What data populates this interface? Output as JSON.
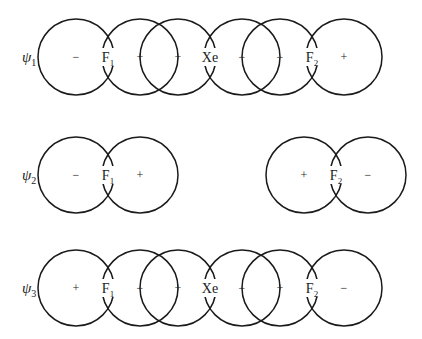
{
  "caption": "",
  "rows": [
    {
      "label": "ψ",
      "sub": "1",
      "cy": 57,
      "lobes": [
        {
          "cx": 76,
          "sign": "−"
        },
        {
          "cx": 140,
          "sign": "+"
        },
        {
          "cx": 178,
          "sign": "+"
        },
        {
          "cx": 242,
          "sign": "−"
        },
        {
          "cx": 280,
          "sign": "−"
        },
        {
          "cx": 344,
          "sign": "+"
        }
      ],
      "atoms": [
        {
          "x": 108,
          "text": "F",
          "sub": "1"
        },
        {
          "x": 210,
          "text": "Xe",
          "sub": ""
        },
        {
          "x": 312,
          "text": "F",
          "sub": "2"
        }
      ]
    },
    {
      "label": "ψ",
      "sub": "2",
      "cy": 175,
      "lobes": [
        {
          "cx": 76,
          "sign": "−"
        },
        {
          "cx": 140,
          "sign": "+"
        },
        {
          "cx": 304,
          "sign": "+"
        },
        {
          "cx": 368,
          "sign": "−"
        }
      ],
      "atoms": [
        {
          "x": 108,
          "text": "F",
          "sub": "1"
        },
        {
          "x": 336,
          "text": "F",
          "sub": "2"
        }
      ]
    },
    {
      "label": "ψ",
      "sub": "3",
      "cy": 288,
      "lobes": [
        {
          "cx": 76,
          "sign": "+"
        },
        {
          "cx": 140,
          "sign": "−"
        },
        {
          "cx": 178,
          "sign": "+"
        },
        {
          "cx": 242,
          "sign": "−"
        },
        {
          "cx": 280,
          "sign": "+"
        },
        {
          "cx": 344,
          "sign": "−"
        }
      ],
      "atoms": [
        {
          "x": 108,
          "text": "F",
          "sub": "1"
        },
        {
          "x": 210,
          "text": "Xe",
          "sub": ""
        },
        {
          "x": 312,
          "text": "F",
          "sub": "2"
        }
      ]
    }
  ],
  "style": {
    "stroke": "#1a1a1a",
    "radius": 38,
    "label_x": 22
  }
}
